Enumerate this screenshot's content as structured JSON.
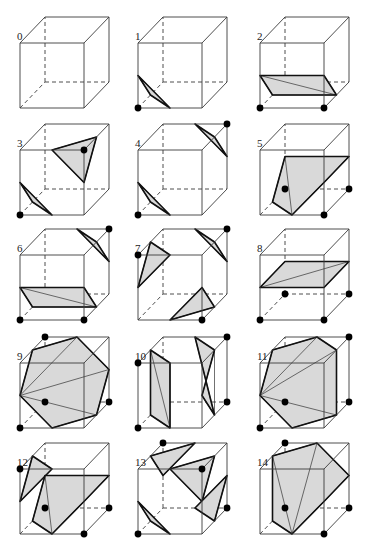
{
  "figure": {
    "fill_color": "#d9d9d9",
    "edge_color": "#3a3a3a",
    "vertex_color": "#000000"
  },
  "cube_geometry": {
    "vertices": {
      "v0": [
        0,
        91
      ],
      "v1": [
        64,
        91
      ],
      "v2": [
        89,
        65
      ],
      "v3": [
        25,
        65
      ],
      "v4": [
        0,
        26
      ],
      "v5": [
        64,
        26
      ],
      "v6": [
        89,
        0
      ],
      "v7": [
        25,
        0
      ]
    }
  },
  "cases": [
    {
      "label": "0",
      "origin": [
        20,
        17
      ],
      "marked": [],
      "surfaces": []
    },
    {
      "label": "1",
      "origin": [
        138,
        17
      ],
      "marked": [
        "v0"
      ],
      "surfaces": [
        [
          [
            "e03"
          ],
          [
            "e01"
          ],
          [
            "e04"
          ]
        ]
      ]
    },
    {
      "label": "2",
      "origin": [
        260,
        17
      ],
      "marked": [
        "v0",
        "v1"
      ],
      "surfaces": [
        [
          [
            "e04"
          ],
          [
            "e15"
          ],
          [
            "e12"
          ],
          [
            "e03"
          ]
        ]
      ]
    },
    {
      "label": "3",
      "origin": [
        20,
        124
      ],
      "marked": [
        "v0",
        "v5"
      ],
      "surfaces": [
        [
          [
            "e03"
          ],
          [
            "e01"
          ],
          [
            "e04"
          ]
        ],
        [
          [
            "e45"
          ],
          [
            "e56"
          ],
          [
            "e15"
          ]
        ]
      ]
    },
    {
      "label": "4",
      "origin": [
        138,
        124
      ],
      "marked": [
        "v0",
        "v6"
      ],
      "surfaces": [
        [
          [
            "e03"
          ],
          [
            "e01"
          ],
          [
            "e04"
          ]
        ],
        [
          [
            "e56"
          ],
          [
            "e67"
          ],
          [
            "e26"
          ]
        ]
      ]
    },
    {
      "label": "5",
      "origin": [
        260,
        124
      ],
      "marked": [
        "v1",
        "v2",
        "v3"
      ],
      "surfaces": [
        [
          [
            "e01"
          ],
          [
            "e15"
          ],
          [
            "e26"
          ],
          [
            "e37"
          ],
          [
            "e03"
          ]
        ]
      ]
    },
    {
      "label": "6",
      "origin": [
        20,
        229
      ],
      "marked": [
        "v0",
        "v1",
        "v6"
      ],
      "surfaces": [
        [
          [
            "e04"
          ],
          [
            "e15"
          ],
          [
            "e12"
          ],
          [
            "e03"
          ]
        ],
        [
          [
            "e56"
          ],
          [
            "e67"
          ],
          [
            "e26"
          ]
        ]
      ]
    },
    {
      "label": "7",
      "origin": [
        138,
        229
      ],
      "marked": [
        "v4",
        "v1",
        "v6"
      ],
      "surfaces": [
        [
          [
            "e47"
          ],
          [
            "e45"
          ],
          [
            "e04"
          ]
        ],
        [
          [
            "e01"
          ],
          [
            "e12"
          ],
          [
            "e15"
          ]
        ],
        [
          [
            "e56"
          ],
          [
            "e67"
          ],
          [
            "e26"
          ]
        ]
      ]
    },
    {
      "label": "8",
      "origin": [
        260,
        229
      ],
      "marked": [
        "v0",
        "v1",
        "v2",
        "v3"
      ],
      "surfaces": [
        [
          [
            "e04"
          ],
          [
            "e15"
          ],
          [
            "e26"
          ],
          [
            "e37"
          ]
        ]
      ]
    },
    {
      "label": "9",
      "origin": [
        20,
        337
      ],
      "marked": [
        "v0",
        "v2",
        "v3",
        "v7"
      ],
      "surfaces": [
        [
          [
            "e04"
          ],
          [
            "e47"
          ],
          [
            "e67"
          ],
          [
            "e26"
          ],
          [
            "e12"
          ],
          [
            "e01"
          ]
        ]
      ]
    },
    {
      "label": "10",
      "origin": [
        138,
        337
      ],
      "marked": [
        "v0",
        "v4",
        "v2",
        "v6"
      ],
      "surfaces": [
        [
          [
            "e01"
          ],
          [
            "e03"
          ],
          [
            "e47"
          ],
          [
            "e45"
          ]
        ],
        [
          [
            "e12"
          ],
          [
            "e15"
          ],
          [
            "e56"
          ],
          [
            "e67"
          ]
        ]
      ]
    },
    {
      "label": "11",
      "origin": [
        260,
        337
      ],
      "marked": [
        "v0",
        "v2",
        "v3",
        "v6"
      ],
      "surfaces": [
        [
          [
            "e04"
          ],
          [
            "e47"
          ],
          [
            "e67"
          ],
          [
            "e56"
          ],
          [
            "e12"
          ],
          [
            "e01"
          ]
        ]
      ]
    },
    {
      "label": "12",
      "origin": [
        20,
        443
      ],
      "marked": [
        "v4",
        "v1",
        "v2",
        "v3"
      ],
      "surfaces": [
        [
          [
            "e47"
          ],
          [
            "e45"
          ],
          [
            "e04"
          ]
        ],
        [
          [
            "e01"
          ],
          [
            "e15"
          ],
          [
            "e26"
          ],
          [
            "e37"
          ],
          [
            "e03"
          ]
        ]
      ]
    },
    {
      "label": "13",
      "origin": [
        138,
        443
      ],
      "marked": [
        "v0",
        "v5",
        "v2",
        "v7"
      ],
      "surfaces": [
        [
          [
            "e03"
          ],
          [
            "e01"
          ],
          [
            "e04"
          ]
        ],
        [
          [
            "e45"
          ],
          [
            "e56"
          ],
          [
            "e15"
          ]
        ],
        [
          [
            "e12"
          ],
          [
            "e26"
          ],
          [
            "e23"
          ]
        ],
        [
          [
            "e37"
          ],
          [
            "e47"
          ],
          [
            "e67"
          ]
        ]
      ]
    },
    {
      "label": "14",
      "origin": [
        260,
        443
      ],
      "marked": [
        "v1",
        "v2",
        "v3",
        "v7"
      ],
      "surfaces": [
        [
          [
            "e01"
          ],
          [
            "e15"
          ],
          [
            "e26"
          ],
          [
            "e67"
          ],
          [
            "e47"
          ],
          [
            "e03"
          ]
        ]
      ]
    }
  ]
}
